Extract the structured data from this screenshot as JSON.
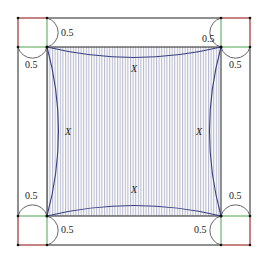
{
  "diagram": {
    "corner_labels": {
      "top_left_right": "0.5",
      "top_left_below": "0.5",
      "top_right_left": "0.5",
      "top_right_below": "0.5",
      "bottom_left_above": "0.5",
      "bottom_left_right": "0.5",
      "bottom_right_above": "0.5",
      "bottom_right_left": "0.5"
    },
    "region_labels": {
      "top": "X",
      "left": "X",
      "right": "X",
      "bottom": "X"
    },
    "colors": {
      "outline": "#222222",
      "curve": "#3a3f80",
      "hatch": "#a9abc4",
      "red_edge": "#e87a7a",
      "green_edge": "#6ab46a",
      "arc": "#555555"
    }
  }
}
